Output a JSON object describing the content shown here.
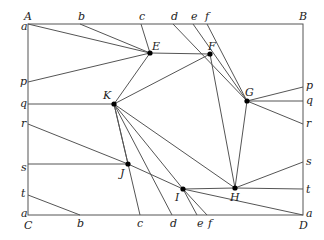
{
  "diagram": {
    "frame": {
      "corners": [
        {
          "id": "A",
          "x": 28,
          "y": 24,
          "label": "A",
          "lx": 24,
          "ly": 20
        },
        {
          "id": "B",
          "x": 303,
          "y": 24,
          "label": "B",
          "lx": 299,
          "ly": 20
        },
        {
          "id": "C",
          "x": 28,
          "y": 215,
          "label": "C",
          "lx": 24,
          "ly": 229
        },
        {
          "id": "D",
          "x": 303,
          "y": 215,
          "label": "D",
          "lx": 299,
          "ly": 229
        }
      ]
    },
    "boundary_labels": [
      {
        "text": "a",
        "x": 21,
        "y": 30
      },
      {
        "text": "b",
        "x": 78,
        "y": 20
      },
      {
        "text": "c",
        "x": 139,
        "y": 20
      },
      {
        "text": "d",
        "x": 171,
        "y": 20
      },
      {
        "text": "e",
        "x": 191,
        "y": 20
      },
      {
        "text": "f",
        "x": 205,
        "y": 20
      },
      {
        "text": "p",
        "x": 20,
        "y": 85
      },
      {
        "text": "q",
        "x": 20,
        "y": 107
      },
      {
        "text": "r",
        "x": 21,
        "y": 127
      },
      {
        "text": "s",
        "x": 21,
        "y": 171
      },
      {
        "text": "t",
        "x": 21,
        "y": 197
      },
      {
        "text": "a",
        "x": 21,
        "y": 217
      },
      {
        "text": "b",
        "x": 77,
        "y": 227
      },
      {
        "text": "c",
        "x": 137,
        "y": 227
      },
      {
        "text": "d",
        "x": 170,
        "y": 227
      },
      {
        "text": "e",
        "x": 197,
        "y": 227
      },
      {
        "text": "f",
        "x": 208,
        "y": 227
      },
      {
        "text": "p",
        "x": 306,
        "y": 89
      },
      {
        "text": "q",
        "x": 306,
        "y": 104
      },
      {
        "text": "r",
        "x": 306,
        "y": 127
      },
      {
        "text": "s",
        "x": 306,
        "y": 165
      },
      {
        "text": "t",
        "x": 306,
        "y": 193
      },
      {
        "text": "a",
        "x": 306,
        "y": 217
      }
    ],
    "points": [
      {
        "id": "E",
        "x": 150,
        "y": 53,
        "label": "E",
        "lx": 152,
        "ly": 50
      },
      {
        "id": "F",
        "x": 210,
        "y": 54,
        "label": "F",
        "lx": 208,
        "ly": 50
      },
      {
        "id": "G",
        "x": 247,
        "y": 101,
        "label": "G",
        "lx": 245,
        "ly": 96
      },
      {
        "id": "H",
        "x": 235,
        "y": 188,
        "label": "H",
        "lx": 230,
        "ly": 201
      },
      {
        "id": "I",
        "x": 183,
        "y": 189,
        "label": "I",
        "lx": 175,
        "ly": 201
      },
      {
        "id": "J",
        "x": 128,
        "y": 164,
        "label": "J",
        "lx": 120,
        "ly": 177
      },
      {
        "id": "K",
        "x": 114,
        "y": 104,
        "label": "K",
        "lx": 103,
        "ly": 99
      }
    ],
    "segments": [
      [
        28,
        24,
        150,
        53
      ],
      [
        80,
        24,
        150,
        53
      ],
      [
        141,
        24,
        150,
        53
      ],
      [
        28,
        82,
        150,
        53
      ],
      [
        150,
        53,
        210,
        54
      ],
      [
        150,
        53,
        114,
        104
      ],
      [
        173,
        24,
        247,
        101
      ],
      [
        193,
        24,
        247,
        101
      ],
      [
        207,
        24,
        247,
        101
      ],
      [
        210,
        54,
        114,
        104
      ],
      [
        210,
        54,
        235,
        188
      ],
      [
        303,
        87,
        247,
        101
      ],
      [
        303,
        101,
        247,
        101
      ],
      [
        303,
        124,
        247,
        101
      ],
      [
        247,
        101,
        235,
        188
      ],
      [
        28,
        104,
        114,
        104
      ],
      [
        114,
        104,
        128,
        164
      ],
      [
        114,
        104,
        140,
        215
      ],
      [
        114,
        104,
        172,
        215
      ],
      [
        114,
        104,
        235,
        188
      ],
      [
        114,
        104,
        183,
        189
      ],
      [
        28,
        124,
        128,
        164
      ],
      [
        128,
        164,
        183,
        189
      ],
      [
        28,
        164,
        128,
        164
      ],
      [
        28,
        195,
        80,
        215
      ],
      [
        303,
        162,
        235,
        188
      ],
      [
        303,
        189,
        235,
        188
      ],
      [
        235,
        188,
        183,
        189
      ],
      [
        183,
        189,
        303,
        215
      ],
      [
        183,
        189,
        197,
        215
      ],
      [
        183,
        189,
        207,
        215
      ]
    ]
  }
}
